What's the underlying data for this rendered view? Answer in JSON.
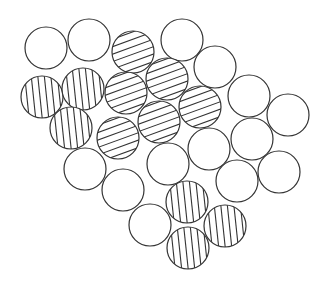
{
  "diagram": {
    "type": "circle-packing",
    "width": 324,
    "height": 285,
    "radius": 21,
    "stroke_color": "#333333",
    "fill_color": "#ffffff",
    "hatch": {
      "horizontal": {
        "angle_deg": -20,
        "spacing": 7
      },
      "vertical": {
        "angle_deg": 84,
        "spacing": 6.5
      }
    },
    "circles": [
      {
        "x": 46,
        "y": 48,
        "pattern": "none"
      },
      {
        "x": 89,
        "y": 40,
        "pattern": "none"
      },
      {
        "x": 133,
        "y": 52,
        "pattern": "horizontal"
      },
      {
        "x": 182,
        "y": 40,
        "pattern": "none"
      },
      {
        "x": 215,
        "y": 67,
        "pattern": "none"
      },
      {
        "x": 249,
        "y": 96,
        "pattern": "none"
      },
      {
        "x": 288,
        "y": 115,
        "pattern": "none"
      },
      {
        "x": 42,
        "y": 97,
        "pattern": "vertical"
      },
      {
        "x": 83,
        "y": 89,
        "pattern": "vertical"
      },
      {
        "x": 126,
        "y": 93,
        "pattern": "horizontal"
      },
      {
        "x": 167,
        "y": 79,
        "pattern": "horizontal"
      },
      {
        "x": 200,
        "y": 107,
        "pattern": "horizontal"
      },
      {
        "x": 71,
        "y": 128,
        "pattern": "vertical"
      },
      {
        "x": 118,
        "y": 138,
        "pattern": "horizontal"
      },
      {
        "x": 159,
        "y": 122,
        "pattern": "horizontal"
      },
      {
        "x": 209,
        "y": 149,
        "pattern": "none"
      },
      {
        "x": 252,
        "y": 139,
        "pattern": "none"
      },
      {
        "x": 85,
        "y": 169,
        "pattern": "none"
      },
      {
        "x": 168,
        "y": 164,
        "pattern": "none"
      },
      {
        "x": 237,
        "y": 181,
        "pattern": "none"
      },
      {
        "x": 279,
        "y": 172,
        "pattern": "none"
      },
      {
        "x": 123,
        "y": 190,
        "pattern": "none"
      },
      {
        "x": 187,
        "y": 202,
        "pattern": "vertical"
      },
      {
        "x": 150,
        "y": 225,
        "pattern": "none"
      },
      {
        "x": 225,
        "y": 226,
        "pattern": "vertical"
      },
      {
        "x": 188,
        "y": 248,
        "pattern": "vertical"
      }
    ]
  }
}
